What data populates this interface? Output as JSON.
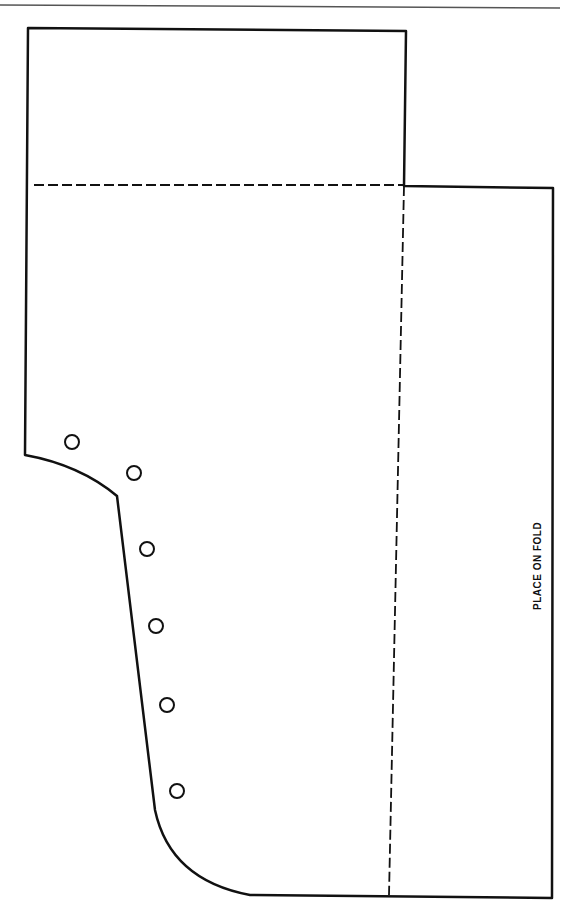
{
  "diagram": {
    "type": "sewing-pattern-piece",
    "stroke_color": "#111111",
    "background_color": "#ffffff",
    "labels": {
      "fold_label": "PLACE ON FOLD"
    },
    "markings": {
      "circle_count": 6,
      "circles": [
        {
          "x": 72,
          "y": 442
        },
        {
          "x": 134,
          "y": 473
        },
        {
          "x": 147,
          "y": 549
        },
        {
          "x": 156,
          "y": 626
        },
        {
          "x": 167,
          "y": 705
        },
        {
          "x": 177,
          "y": 791
        }
      ]
    }
  }
}
